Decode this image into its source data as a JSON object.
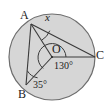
{
  "figure": {
    "type": "circle-with-inscribed-angle",
    "colors": {
      "background": "#ffffff",
      "circle_fill": "#d6d6d6",
      "circle_stroke": "#6e6e6e",
      "line_stroke": "#3a3a3a",
      "label_color": "#1b1b1b"
    },
    "circle": {
      "center_label": "O",
      "center_x": 52,
      "center_y": 57,
      "radius": 43
    },
    "points": [
      {
        "label": "A",
        "x": 31,
        "y": 24
      },
      {
        "label": "B",
        "x": 26,
        "y": 85
      },
      {
        "label": "C",
        "x": 95,
        "y": 57
      },
      {
        "label": "O",
        "x": 52,
        "y": 57
      }
    ],
    "segments": [
      {
        "name": "chord-AB",
        "from": "A",
        "to": "B"
      },
      {
        "name": "chord-AC",
        "from": "A",
        "to": "C"
      },
      {
        "name": "radius-AO",
        "from": "A",
        "to": "O"
      },
      {
        "name": "radius-OB",
        "from": "O",
        "to": "B"
      },
      {
        "name": "radius-OC",
        "from": "O",
        "to": "C"
      }
    ],
    "labels": {
      "point_a": "A",
      "point_b": "B",
      "point_c": "C",
      "point_o": "O",
      "unknown_angle": "x",
      "central_angle": "130°",
      "angle_at_b": "35°"
    },
    "angle_marks": [
      {
        "name": "arc-at-A",
        "vertex": "A",
        "value": "x"
      },
      {
        "name": "arc-at-B",
        "vertex": "B",
        "value": "35°"
      },
      {
        "name": "arc-at-O",
        "vertex": "O",
        "value": "130°"
      }
    ]
  }
}
